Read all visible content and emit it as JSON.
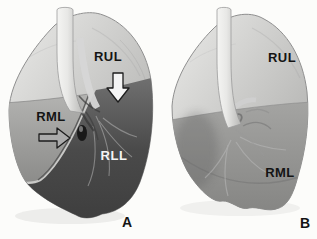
{
  "colors": {
    "background": "#fcfcfa",
    "arrow_down_fill": "#f4f4f4",
    "arrow_right_fill": "#ababab",
    "arrow_outline": "#1c1c1c",
    "label_dark": "#141414",
    "label_light": "#f4f4f4",
    "rul_tone": "#c6c6c4",
    "rml_tone": "#979795",
    "rll_tone": "#4a4a4a"
  },
  "panelA": {
    "panel_label": "A",
    "labels": {
      "rul": "RUL",
      "rml": "RML",
      "rll": "RLL"
    }
  },
  "panelB": {
    "panel_label": "B",
    "labels": {
      "rul": "RUL",
      "rml": "RML"
    }
  }
}
